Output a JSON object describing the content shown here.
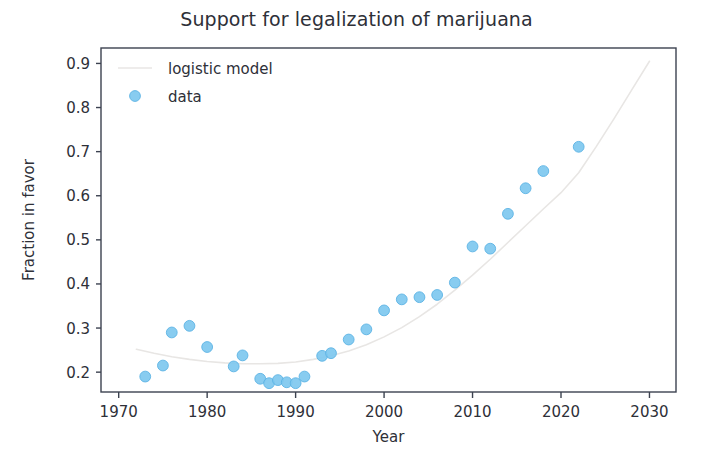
{
  "chart_data": {
    "type": "scatter",
    "title": "Support for legalization of marijuana",
    "xlabel": "Year",
    "ylabel": "Fraction in favor",
    "xlim": [
      1968,
      2033
    ],
    "ylim": [
      0.155,
      0.935
    ],
    "grid": false,
    "legend_position": "upper left",
    "xticks": [
      1970,
      1980,
      1990,
      2000,
      2010,
      2020,
      2030
    ],
    "xtick_labels": [
      "1970",
      "1980",
      "1990",
      "2000",
      "2010",
      "2020",
      "2030"
    ],
    "yticks": [
      0.2,
      0.3,
      0.4,
      0.5,
      0.6,
      0.7,
      0.8,
      0.9
    ],
    "ytick_labels": [
      "0.2",
      "0.3",
      "0.4",
      "0.5",
      "0.6",
      "0.7",
      "0.8",
      "0.9"
    ],
    "marker_color": "#7ec8ef",
    "marker_edge_color": "#5cb3e4",
    "line_color": "#e8e6e4",
    "axis_color": "#3c4250",
    "series": [
      {
        "name": "data",
        "type": "scatter",
        "x": [
          1973,
          1975,
          1976,
          1978,
          1980,
          1983,
          1984,
          1986,
          1987,
          1988,
          1989,
          1990,
          1991,
          1993,
          1994,
          1996,
          1998,
          2000,
          2002,
          2004,
          2006,
          2008,
          2010,
          2012,
          2014,
          2016,
          2018,
          2022
        ],
        "y": [
          0.19,
          0.215,
          0.29,
          0.305,
          0.257,
          0.213,
          0.238,
          0.185,
          0.175,
          0.182,
          0.177,
          0.175,
          0.19,
          0.237,
          0.243,
          0.274,
          0.297,
          0.34,
          0.365,
          0.37,
          0.375,
          0.403,
          0.485,
          0.48,
          0.559,
          0.617,
          0.656,
          0.711
        ]
      },
      {
        "name": "logistic model",
        "type": "line",
        "x": [
          1972,
          1974,
          1976,
          1978,
          1980,
          1982,
          1984,
          1986,
          1988,
          1990,
          1992,
          1994,
          1996,
          1998,
          2000,
          2002,
          2004,
          2006,
          2008,
          2010,
          2012,
          2014,
          2016,
          2018,
          2020,
          2022,
          2024,
          2026,
          2028,
          2030
        ],
        "y": [
          0.252,
          0.243,
          0.235,
          0.229,
          0.224,
          0.221,
          0.219,
          0.219,
          0.22,
          0.223,
          0.229,
          0.237,
          0.248,
          0.262,
          0.28,
          0.301,
          0.326,
          0.354,
          0.386,
          0.42,
          0.456,
          0.494,
          0.532,
          0.57,
          0.607,
          0.652,
          0.712,
          0.775,
          0.84,
          0.905
        ]
      }
    ]
  },
  "legend": {
    "entries": [
      {
        "label": "logistic model",
        "marker": "line-swatch"
      },
      {
        "label": "data",
        "marker": "dot-swatch"
      }
    ]
  }
}
